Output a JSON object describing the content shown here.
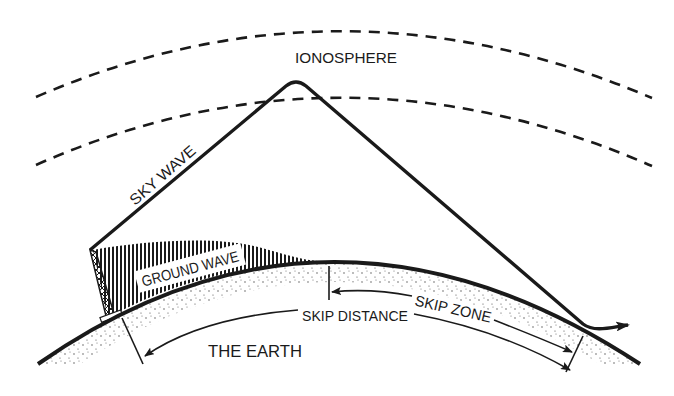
{
  "labels": {
    "ionosphere": "IONOSPHERE",
    "sky_wave": "SKY WAVE",
    "ground_wave": "GROUND WAVE",
    "skip_zone": "SKIP ZONE",
    "skip_distance": "SKIP DISTANCE",
    "the_earth": "THE EARTH"
  },
  "colors": {
    "ink": "#1a1a1a",
    "background": "#ffffff"
  }
}
